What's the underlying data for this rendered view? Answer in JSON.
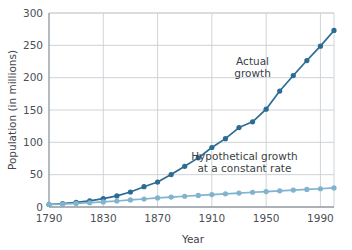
{
  "chart_data": {
    "type": "line",
    "title": "",
    "xlabel": "Year",
    "ylabel": "Population (in millions)",
    "xlim": [
      1790,
      2000
    ],
    "ylim": [
      0,
      300
    ],
    "xticks": [
      1790,
      1830,
      1870,
      1910,
      1950,
      1990
    ],
    "yticks": [
      0,
      50,
      100,
      150,
      200,
      250,
      300
    ],
    "grid": true,
    "legend": "none",
    "x": [
      1790,
      1800,
      1810,
      1820,
      1830,
      1840,
      1850,
      1860,
      1870,
      1880,
      1890,
      1900,
      1910,
      1920,
      1930,
      1940,
      1950,
      1960,
      1970,
      1980,
      1990,
      2000
    ],
    "series": [
      {
        "name": "Actual growth",
        "color": "#2c6c92",
        "values": [
          3.9,
          5.3,
          7.2,
          9.6,
          12.9,
          17.1,
          23.2,
          31.4,
          38.6,
          50.2,
          62.9,
          76.0,
          92.0,
          105.7,
          122.8,
          131.7,
          151.3,
          179.3,
          203.3,
          226.5,
          248.7,
          273.0
        ]
      },
      {
        "name": "Hypothetical growth at a constant rate",
        "color": "#7fb3ce",
        "values": [
          3.9,
          4.6,
          5.5,
          6.6,
          7.8,
          9.3,
          11.0,
          12.4,
          14.0,
          15.3,
          16.6,
          17.9,
          19.2,
          20.4,
          21.6,
          22.8,
          23.9,
          25.0,
          26.1,
          27.2,
          28.2,
          29.5
        ]
      }
    ],
    "annotations": [
      {
        "name": "actual-growth-label",
        "lines": [
          "Actual",
          "growth"
        ],
        "x": 1940,
        "y": 220
      },
      {
        "name": "hypothetical-growth-label",
        "lines": [
          "Hypothetical growth",
          "at a constant rate"
        ],
        "x": 1934,
        "y": 72
      }
    ]
  },
  "axes": {
    "x_tick_labels": [
      "1790",
      "1830",
      "1870",
      "1910",
      "1950",
      "1990"
    ],
    "y_tick_labels": [
      "0",
      "50",
      "100",
      "150",
      "200",
      "250",
      "300"
    ],
    "x_axis_title": "Year",
    "y_axis_title": "Population (in millions)"
  },
  "colors": {
    "actual_line": "#2c6c92",
    "hypothetical_line": "#7fb3ce",
    "grid": "#c9cfd4",
    "axis": "#8f979e",
    "text": "#3f444a",
    "background": "#ffffff"
  }
}
